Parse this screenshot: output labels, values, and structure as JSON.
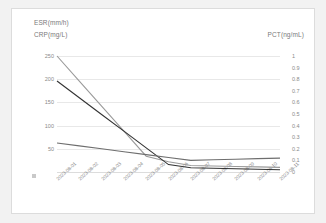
{
  "card": {
    "background": "#ffffff",
    "border_color": "#dcdcdc"
  },
  "chart_data": {
    "type": "line",
    "title": "",
    "subtitle": "",
    "xlabel": "",
    "ylabel": "ESR(mm/h) CRP(mg/L)",
    "y2label": "PCT(ng/mL)",
    "grid": true,
    "legend_position": "top-left",
    "x": [
      "2023-08-01",
      "2023-08-02",
      "2023-08-03",
      "2023-08-04",
      "2023-08-05",
      "2023-08-06",
      "2023-08-07",
      "2023-08-08",
      "2023-08-09",
      "2023-08-10",
      "2023-08-11"
    ],
    "ylim": [
      0,
      250
    ],
    "yticks": [
      50,
      100,
      150,
      200,
      250
    ],
    "y2lim": [
      0,
      1
    ],
    "y2ticks": [
      0,
      0.1,
      0.2,
      0.3,
      0.4,
      0.5,
      0.6,
      0.7,
      0.8,
      0.9,
      1
    ],
    "series": [
      {
        "name": "ESR(mm/h)",
        "axis": "left",
        "color": "#9a9a9a",
        "values": [
          250,
          196,
          142,
          88,
          34,
          22,
          14,
          13,
          12,
          11,
          10
        ]
      },
      {
        "name": "CRP(mg/L)",
        "axis": "left",
        "color": "#333333",
        "values": [
          196,
          160,
          124,
          88,
          52,
          16,
          9,
          8,
          7,
          6,
          5
        ]
      },
      {
        "name": "PCT(ng/mL)",
        "axis": "right",
        "color": "#6e6e6e",
        "values": [
          0.25,
          0.225,
          0.2,
          0.175,
          0.15,
          0.125,
          0.1,
          0.105,
          0.11,
          0.115,
          0.12
        ]
      }
    ]
  },
  "axis_titles": {
    "esr": "ESR(mm/h)",
    "crp": "CRP(mg/L)",
    "pct": "PCT(ng/mL)"
  },
  "left_ticks": [
    "250",
    "200",
    "150",
    "100",
    "50"
  ],
  "right_ticks": [
    "1",
    "0.9",
    "0.8",
    "0.7",
    "0.6",
    "0.5",
    "0.4",
    "0.3",
    "0.2",
    "0.1",
    "0"
  ]
}
